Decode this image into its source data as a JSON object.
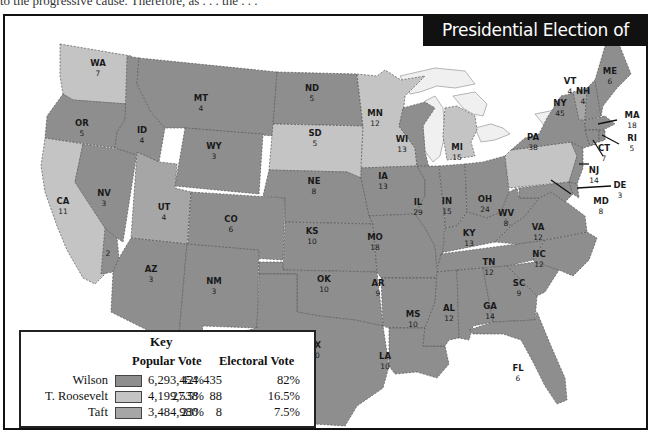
{
  "page": {
    "clipped_text": "to the progressive cause. Therefore, as . . . the . . ."
  },
  "map": {
    "title": "Presidential Election of 1912",
    "colors": {
      "wilson": "#8e8e8e",
      "roosevelt": "#c4c4c4",
      "taft": "#a6a6a6",
      "water": "#f0f0f0",
      "background": "#ffffff"
    },
    "states": [
      {
        "abbr": "WA",
        "ev": "7",
        "winner": "roosevelt"
      },
      {
        "abbr": "OR",
        "ev": "5",
        "winner": "wilson"
      },
      {
        "abbr": "CA",
        "ev": "11",
        "winner": "roosevelt"
      },
      {
        "abbr": "CA-split",
        "ev": "2",
        "winner": "wilson"
      },
      {
        "abbr": "NV",
        "ev": "3",
        "winner": "wilson"
      },
      {
        "abbr": "ID",
        "ev": "4",
        "winner": "wilson"
      },
      {
        "abbr": "MT",
        "ev": "4",
        "winner": "wilson"
      },
      {
        "abbr": "WY",
        "ev": "3",
        "winner": "wilson"
      },
      {
        "abbr": "UT",
        "ev": "4",
        "winner": "taft"
      },
      {
        "abbr": "CO",
        "ev": "6",
        "winner": "wilson"
      },
      {
        "abbr": "AZ",
        "ev": "3",
        "winner": "wilson"
      },
      {
        "abbr": "NM",
        "ev": "3",
        "winner": "wilson"
      },
      {
        "abbr": "ND",
        "ev": "5",
        "winner": "wilson"
      },
      {
        "abbr": "SD",
        "ev": "5",
        "winner": "roosevelt"
      },
      {
        "abbr": "NE",
        "ev": "8",
        "winner": "wilson"
      },
      {
        "abbr": "KS",
        "ev": "10",
        "winner": "wilson"
      },
      {
        "abbr": "OK",
        "ev": "10",
        "winner": "wilson"
      },
      {
        "abbr": "TX",
        "ev": "20",
        "winner": "wilson"
      },
      {
        "abbr": "MN",
        "ev": "12",
        "winner": "roosevelt"
      },
      {
        "abbr": "IA",
        "ev": "13",
        "winner": "wilson"
      },
      {
        "abbr": "MO",
        "ev": "18",
        "winner": "wilson"
      },
      {
        "abbr": "AR",
        "ev": "9",
        "winner": "wilson"
      },
      {
        "abbr": "LA",
        "ev": "10",
        "winner": "wilson"
      },
      {
        "abbr": "WI",
        "ev": "13",
        "winner": "wilson"
      },
      {
        "abbr": "IL",
        "ev": "29",
        "winner": "wilson"
      },
      {
        "abbr": "MI",
        "ev": "15",
        "winner": "roosevelt"
      },
      {
        "abbr": "IN",
        "ev": "15",
        "winner": "wilson"
      },
      {
        "abbr": "OH",
        "ev": "24",
        "winner": "wilson"
      },
      {
        "abbr": "KY",
        "ev": "13",
        "winner": "wilson"
      },
      {
        "abbr": "TN",
        "ev": "12",
        "winner": "wilson"
      },
      {
        "abbr": "MS",
        "ev": "10",
        "winner": "wilson"
      },
      {
        "abbr": "AL",
        "ev": "12",
        "winner": "wilson"
      },
      {
        "abbr": "GA",
        "ev": "14",
        "winner": "wilson"
      },
      {
        "abbr": "FL",
        "ev": "6",
        "winner": "wilson"
      },
      {
        "abbr": "SC",
        "ev": "9",
        "winner": "wilson"
      },
      {
        "abbr": "NC",
        "ev": "12",
        "winner": "wilson"
      },
      {
        "abbr": "VA",
        "ev": "12",
        "winner": "wilson"
      },
      {
        "abbr": "WV",
        "ev": "8",
        "winner": "wilson"
      },
      {
        "abbr": "PA",
        "ev": "38",
        "winner": "roosevelt"
      },
      {
        "abbr": "NY",
        "ev": "45",
        "winner": "wilson"
      },
      {
        "abbr": "VT",
        "ev": "4",
        "winner": "taft"
      },
      {
        "abbr": "NH",
        "ev": "4",
        "winner": "wilson"
      },
      {
        "abbr": "ME",
        "ev": "6",
        "winner": "wilson"
      },
      {
        "abbr": "MA",
        "ev": "18",
        "winner": "wilson"
      },
      {
        "abbr": "RI",
        "ev": "5",
        "winner": "wilson"
      },
      {
        "abbr": "CT",
        "ev": "7",
        "winner": "wilson"
      },
      {
        "abbr": "NJ",
        "ev": "14",
        "winner": "wilson"
      },
      {
        "abbr": "DE",
        "ev": "3",
        "winner": "wilson"
      },
      {
        "abbr": "MD",
        "ev": "8",
        "winner": "wilson"
      }
    ]
  },
  "key": {
    "title": "Key",
    "header_popular": "Popular Vote",
    "header_electoral": "Electoral Vote",
    "rows": [
      {
        "candidate": "Wilson",
        "popular": "6,293,454",
        "popular_pct": "42%",
        "electoral": "435",
        "electoral_pct": "82%"
      },
      {
        "candidate": "T. Roosevelt",
        "popular": "4,199,538",
        "popular_pct": "27.5%",
        "electoral": "88",
        "electoral_pct": "16.5%"
      },
      {
        "candidate": "Taft",
        "popular": "3,484,980",
        "popular_pct": "23%",
        "electoral": "8",
        "electoral_pct": "7.5%"
      }
    ]
  }
}
